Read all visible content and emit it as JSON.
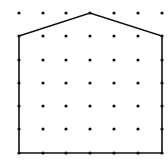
{
  "figure": {
    "type": "dot-grid-polygon",
    "grid": {
      "columns": 7,
      "rows": 7,
      "x_positions": [
        19,
        43,
        66,
        90,
        114,
        138,
        162
      ],
      "y_positions": [
        13,
        36,
        60,
        83,
        106,
        129,
        153
      ],
      "dot_color": "#111111",
      "dot_radius": 1.6
    },
    "polygon": {
      "shape": "pentagon",
      "vertices_grid": [
        [
          0,
          1
        ],
        [
          3,
          0
        ],
        [
          6,
          1
        ],
        [
          6,
          6
        ],
        [
          0,
          6
        ]
      ],
      "stroke_color": "#111111",
      "stroke_width": 1.6
    },
    "background": "#ffffff"
  }
}
